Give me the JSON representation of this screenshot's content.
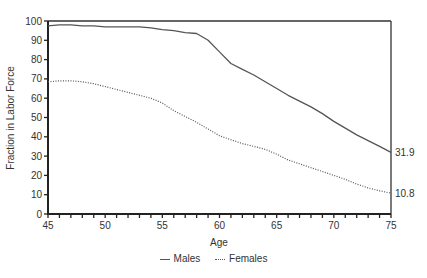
{
  "chart_data": {
    "type": "line",
    "title": "",
    "xlabel": "Age",
    "ylabel": "Fraction in Labor Force",
    "xlim": [
      45,
      75
    ],
    "ylim": [
      0,
      100
    ],
    "x_ticks": [
      45,
      50,
      55,
      60,
      65,
      70,
      75
    ],
    "y_ticks": [
      0,
      10,
      20,
      30,
      40,
      50,
      60,
      70,
      80,
      90,
      100
    ],
    "grid": false,
    "legend_position": "bottom",
    "x": [
      45,
      46,
      47,
      48,
      49,
      50,
      51,
      52,
      53,
      54,
      55,
      56,
      57,
      58,
      59,
      60,
      61,
      62,
      63,
      64,
      65,
      66,
      67,
      68,
      69,
      70,
      71,
      72,
      73,
      74,
      75
    ],
    "series": [
      {
        "name": "Males",
        "style": "solid",
        "values": [
          97.5,
          98,
          98,
          97.5,
          97.5,
          97,
          97,
          97,
          97,
          96.5,
          95.5,
          95,
          94,
          93.5,
          90,
          84,
          78,
          75,
          72,
          68.5,
          65,
          61.5,
          58.5,
          55.5,
          52,
          48,
          44.5,
          41,
          38,
          35,
          31.9
        ],
        "end_label": "31.9"
      },
      {
        "name": "Females",
        "style": "dotted",
        "values": [
          68.5,
          69,
          69,
          68.5,
          67.5,
          66,
          64.5,
          63,
          61.5,
          60,
          57.5,
          53.5,
          50.5,
          47.5,
          44,
          40.5,
          38.5,
          36.5,
          35,
          33.5,
          31,
          28,
          26,
          24,
          22,
          20,
          18,
          15.5,
          13.5,
          12,
          10.8
        ],
        "end_label": "10.8"
      }
    ]
  },
  "legend": {
    "items": [
      {
        "label": "Males"
      },
      {
        "label": "Females"
      }
    ]
  }
}
